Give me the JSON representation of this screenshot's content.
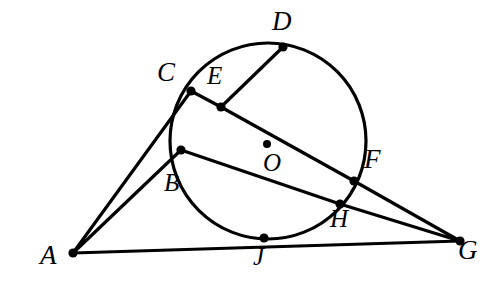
{
  "figure": {
    "type": "euclidean-geometry-diagram",
    "canvas": {
      "width": 489,
      "height": 305
    },
    "stroke_color": "#000000",
    "background_color": "#ffffff",
    "line_width": 3.2,
    "dot_radius": 4.6,
    "center_dot_radius": 4.0
  },
  "circle": {
    "name": "circle-O",
    "center": {
      "x": 268,
      "y": 141
    },
    "radius": 98,
    "label": "O",
    "center_label_position": {
      "x": 263,
      "y": 150
    },
    "center_dot": {
      "x": 267,
      "y": 144
    }
  },
  "points": [
    {
      "id": "A",
      "label": "A",
      "x": 73,
      "y": 253,
      "label_x": 40,
      "label_y": 242,
      "on_circle": false,
      "size": "lbl-lg"
    },
    {
      "id": "B",
      "label": "B",
      "x": 181,
      "y": 150,
      "label_x": 164,
      "label_y": 170,
      "on_circle": true,
      "size": "lbl-md"
    },
    {
      "id": "C",
      "label": "C",
      "x": 191,
      "y": 91,
      "label_x": 157,
      "label_y": 59,
      "on_circle": true,
      "size": "lbl-lg"
    },
    {
      "id": "D",
      "label": "D",
      "x": 283,
      "y": 47,
      "label_x": 272,
      "label_y": 8,
      "on_circle": true,
      "size": "lbl-lg"
    },
    {
      "id": "E",
      "label": "E",
      "x": 221,
      "y": 107,
      "label_x": 207,
      "label_y": 63,
      "on_circle": false,
      "size": "lbl-md"
    },
    {
      "id": "F",
      "label": "F",
      "x": 354,
      "y": 181,
      "label_x": 364,
      "label_y": 146,
      "on_circle": true,
      "size": "lbl-lg"
    },
    {
      "id": "G",
      "label": "G",
      "x": 460,
      "y": 241,
      "label_x": 458,
      "label_y": 237,
      "on_circle": false,
      "size": "lbl-lg"
    },
    {
      "id": "H",
      "label": "H",
      "x": 340,
      "y": 204,
      "label_x": 330,
      "label_y": 206,
      "on_circle": true,
      "size": "lbl-md"
    },
    {
      "id": "J",
      "label": "J",
      "x": 264,
      "y": 238,
      "label_x": 253,
      "label_y": 244,
      "on_circle": true,
      "size": "lbl-md"
    }
  ],
  "segments": [
    {
      "name": "segment-A-C",
      "from": "A",
      "to": "C"
    },
    {
      "name": "segment-A-B",
      "from": "A",
      "to": "B"
    },
    {
      "name": "segment-A-G",
      "from": "A",
      "to": "G"
    },
    {
      "name": "segment-C-E",
      "from": "C",
      "to": "E"
    },
    {
      "name": "segment-E-D",
      "from": "E",
      "to": "D"
    },
    {
      "name": "segment-E-F",
      "from": "E",
      "to": "F"
    },
    {
      "name": "segment-B-H",
      "from": "B",
      "to": "H"
    },
    {
      "name": "segment-F-G",
      "from": "F",
      "to": "G"
    },
    {
      "name": "segment-H-G",
      "from": "H",
      "to": "G"
    }
  ],
  "notes": {
    "secant_through_A": "Line A-C meets circle at C; line A-B meets circle at B; line A-G passes through J on the circle",
    "secant_through_G": "Line G-F meets circle at F; line G-H meets circle at H",
    "chord_C_E_F": "C, E and F are collinear along the long chord; E lies inside the circle",
    "chord_E_D": "E connects to D on the circle"
  }
}
